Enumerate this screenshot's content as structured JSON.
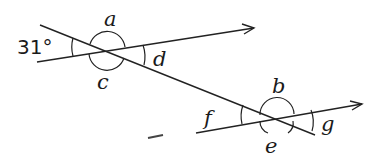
{
  "diagram": {
    "type": "parallel-lines-transversal",
    "given_angle": "31°",
    "labels": {
      "a": "a",
      "b": "b",
      "c": "c",
      "d": "d",
      "e": "e",
      "f": "f",
      "g": "g"
    },
    "colors": {
      "stroke": "#222222",
      "background": "#ffffff"
    }
  }
}
